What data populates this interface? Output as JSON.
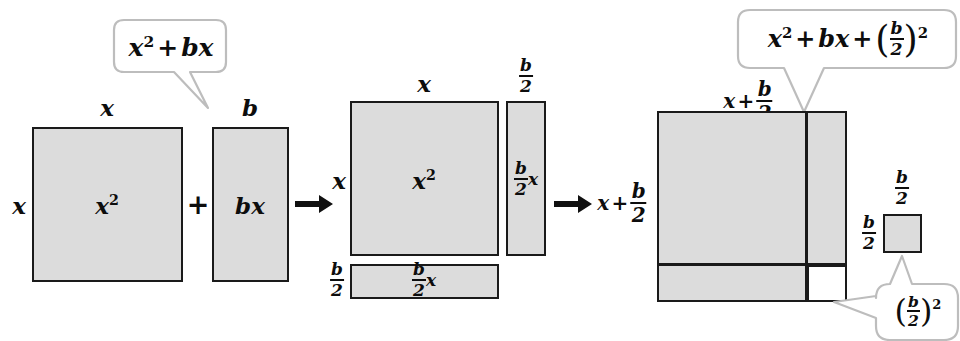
{
  "diagram": {
    "colors": {
      "fill": "#dcdcdc",
      "stroke": "#1a1a1a",
      "white": "#ffffff",
      "bubble_stroke": "#b8b8b8"
    },
    "callouts": [
      {
        "id": "callout-left",
        "expression": "x^2 + bx"
      },
      {
        "id": "callout-top-right",
        "expression": "x^2 + bx + (b/2)^2"
      },
      {
        "id": "callout-bottom-right",
        "expression": "(b/2)^2"
      }
    ],
    "stage1": {
      "square": {
        "area_label": "x^2",
        "top_label": "x",
        "left_label": "x"
      },
      "plus_sign": "+",
      "rect": {
        "area_label": "bx",
        "top_label": "b"
      }
    },
    "arrows": {
      "first": "arrow-right",
      "second": "arrow-right"
    },
    "stage2": {
      "square": {
        "area_label": "x^2",
        "top_label": "x",
        "left_label": "x"
      },
      "vstrip": {
        "area_label": "(b/2)x",
        "top_label": "b/2"
      },
      "hstrip": {
        "area_label": "(b/2)x",
        "left_label": "b/2"
      },
      "result_label": "x + b/2"
    },
    "stage3": {
      "big_square": {
        "top_label": "x + b/2",
        "left_label": "x + b/2"
      },
      "small_square": {
        "top_label": "b/2",
        "left_label": "b/2"
      }
    }
  }
}
